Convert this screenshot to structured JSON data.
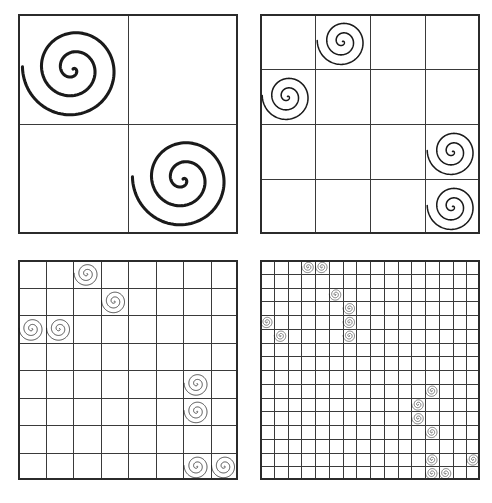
{
  "figure": {
    "title": "",
    "background_color": "#ffffff",
    "line_color": "#3a3a3a",
    "border_color": "#2b2b2b",
    "spiral_color": "#1a1a1a",
    "panel_count": 4
  },
  "chart_data": {
    "type": "heatmap",
    "title": "",
    "xlabel": "",
    "ylabel": "",
    "grid": true,
    "legend_position": "none",
    "marker": "spiral",
    "panels": [
      {
        "name": "panel-top-left",
        "index": 0,
        "rows": 2,
        "cols": 2,
        "x": 18,
        "y": 14,
        "size": 220,
        "spiral_scale": 1.0,
        "cells": [
          {
            "row": 0,
            "col": 0
          },
          {
            "row": 1,
            "col": 1
          }
        ]
      },
      {
        "name": "panel-top-right",
        "index": 1,
        "rows": 4,
        "cols": 4,
        "x": 260,
        "y": 14,
        "size": 220,
        "spiral_scale": 0.5,
        "cells": [
          {
            "row": 0,
            "col": 1
          },
          {
            "row": 1,
            "col": 0
          },
          {
            "row": 2,
            "col": 3
          },
          {
            "row": 3,
            "col": 3
          }
        ]
      },
      {
        "name": "panel-bottom-left",
        "index": 2,
        "rows": 8,
        "cols": 8,
        "x": 18,
        "y": 260,
        "size": 220,
        "spiral_scale": 0.25,
        "cells": [
          {
            "row": 0,
            "col": 2
          },
          {
            "row": 1,
            "col": 3
          },
          {
            "row": 2,
            "col": 0
          },
          {
            "row": 2,
            "col": 1
          },
          {
            "row": 4,
            "col": 6
          },
          {
            "row": 5,
            "col": 6
          },
          {
            "row": 7,
            "col": 6
          },
          {
            "row": 7,
            "col": 7
          }
        ]
      },
      {
        "name": "panel-bottom-right",
        "index": 3,
        "rows": 16,
        "cols": 16,
        "x": 260,
        "y": 260,
        "size": 220,
        "spiral_scale": 0.125,
        "cells": [
          {
            "row": 0,
            "col": 3
          },
          {
            "row": 0,
            "col": 4
          },
          {
            "row": 2,
            "col": 5
          },
          {
            "row": 3,
            "col": 6
          },
          {
            "row": 4,
            "col": 0
          },
          {
            "row": 4,
            "col": 6
          },
          {
            "row": 5,
            "col": 1
          },
          {
            "row": 5,
            "col": 6
          },
          {
            "row": 9,
            "col": 12
          },
          {
            "row": 10,
            "col": 11
          },
          {
            "row": 11,
            "col": 11
          },
          {
            "row": 12,
            "col": 12
          },
          {
            "row": 14,
            "col": 12
          },
          {
            "row": 14,
            "col": 15
          },
          {
            "row": 15,
            "col": 12
          },
          {
            "row": 15,
            "col": 13
          }
        ]
      }
    ]
  }
}
